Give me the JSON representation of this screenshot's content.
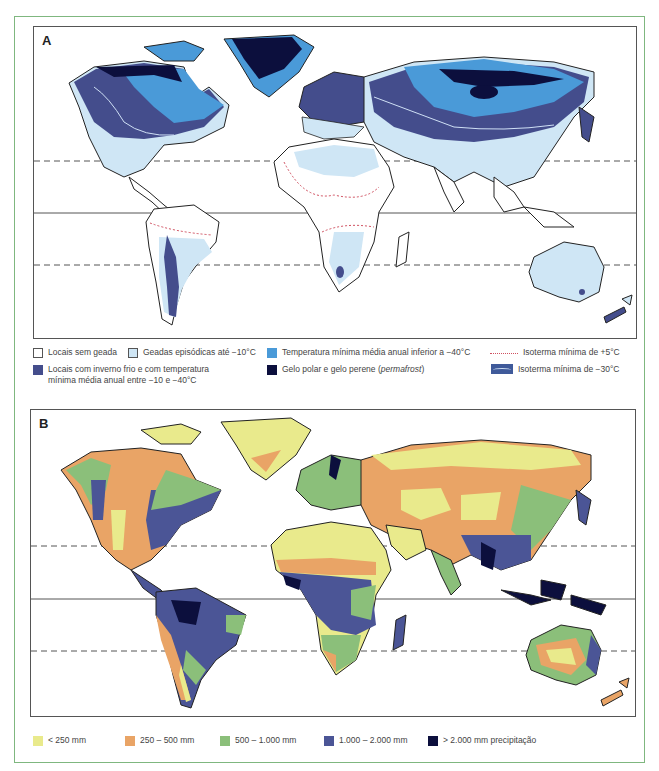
{
  "mapA": {
    "label": "A",
    "theme": "Minimum temperatures / frost",
    "legend": [
      {
        "id": "no-frost",
        "label": "Locais sem geada",
        "color": "#ffffff",
        "style": "box-outline"
      },
      {
        "id": "episodic-frost",
        "label": "Geadas episódicas até −10°C",
        "color": "#cfe6f5",
        "style": "box-outline"
      },
      {
        "id": "below-40",
        "label": "Temperatura mínima média anual inferior a −40°C",
        "color": "#4a9ad8",
        "style": "box"
      },
      {
        "id": "iso-plus5",
        "label": "Isoterma mínima de +5°C",
        "color": "#d05060",
        "style": "dotted-line"
      },
      {
        "id": "cold-winter",
        "label": "Locais com inverno frio e com temperatura mínima média anual entre −10 e −40°C",
        "color": "#444d8c",
        "style": "box"
      },
      {
        "id": "permafrost",
        "label_prefix": "Gelo polar e gelo perene (",
        "label_italic": "permafrost",
        "label_suffix": ")",
        "color": "#0c0f3d",
        "style": "box"
      },
      {
        "id": "iso-minus30",
        "label": "Isoterma mínima de −30°C",
        "color": "#3f5a9a",
        "style": "line-swatch"
      }
    ]
  },
  "mapB": {
    "label": "B",
    "theme": "Annual precipitation",
    "legend": [
      {
        "id": "lt250",
        "label": "< 250 mm",
        "color": "#e9ea8c"
      },
      {
        "id": "250-500",
        "label": "250 – 500 mm",
        "color": "#e9a466"
      },
      {
        "id": "500-1000",
        "label": "500 – 1.000 mm",
        "color": "#8bbf7a"
      },
      {
        "id": "1000-2000",
        "label": "1.000 – 2.000 mm",
        "color": "#4b5596"
      },
      {
        "id": "gt2000",
        "label": "> 2.000 mm precipitação",
        "color": "#0c0f3d"
      }
    ]
  },
  "colors": {
    "frame": "#7fb77f",
    "coast": "#222222",
    "gridline": "#555555"
  }
}
